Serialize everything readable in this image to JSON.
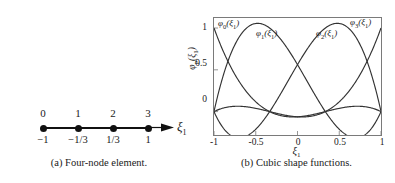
{
  "figure": {
    "panel_a": {
      "caption": "(a)  Four-node element.",
      "axis_symbol": "ξ",
      "axis_symbol_sub": "1",
      "nodes": [
        {
          "index": "0",
          "coord": "−1"
        },
        {
          "index": "1",
          "coord": "−1/3"
        },
        {
          "index": "2",
          "coord": "1/3"
        },
        {
          "index": "3",
          "coord": "1"
        }
      ]
    },
    "panel_b": {
      "caption": "(b)  Cubic shape functions.",
      "xlabel_sym": "ξ",
      "xlabel_sub": "1",
      "ylabel_sym": "φ",
      "ylabel_sub": "p",
      "ylabel_arg": "(ξ",
      "ylabel_arg_sub": "1",
      "ylabel_close": ")",
      "xticks": [
        "-1",
        "-0.5",
        "0",
        "0.5",
        "1"
      ],
      "yticks": [
        "1",
        "0.5",
        "0"
      ],
      "curve_labels": [
        {
          "name": "φ",
          "sub": "0",
          "arg": "(ξ",
          "argsub": "1",
          "close": ")"
        },
        {
          "name": "φ",
          "sub": "1",
          "arg": "(ξ",
          "argsub": "1",
          "close": ")"
        },
        {
          "name": "φ",
          "sub": "2",
          "arg": "(ξ",
          "argsub": "1",
          "close": ")"
        },
        {
          "name": "φ",
          "sub": "3",
          "arg": "(ξ",
          "argsub": "1",
          "close": ")"
        }
      ]
    }
  },
  "colors": {
    "curve": "#333333",
    "axis": "#7a7a7a",
    "node": "#111111",
    "background": "#ffffff"
  },
  "chart_data": {
    "type": "line",
    "title": "",
    "subtitle": "",
    "xlabel": "ξ1",
    "ylabel": "φp(ξ1)",
    "xlim": [
      -1,
      1
    ],
    "ylim": [
      -0.28,
      1.12
    ],
    "xticks": [
      -1,
      -0.5,
      0,
      0.5,
      1
    ],
    "yticks": [
      0,
      0.5,
      1
    ],
    "grid": false,
    "legend_position": "inline-annotations",
    "nodes_xi": [
      -1,
      -0.3333,
      0.3333,
      1
    ],
    "annotations": [
      {
        "text": "φ0(ξ1)",
        "x": -0.89,
        "y": 1.09
      },
      {
        "text": "φ1(ξ1)",
        "x": -0.43,
        "y": 0.96
      },
      {
        "text": "φ2(ξ1)",
        "x": 0.33,
        "y": 0.96
      },
      {
        "text": "φ3(ξ1)",
        "x": 0.76,
        "y": 1.09
      }
    ],
    "x": [
      -1.0,
      -0.9,
      -0.8,
      -0.7,
      -0.6,
      -0.5,
      -0.4,
      -0.3,
      -0.2,
      -0.1,
      0.0,
      0.1,
      0.2,
      0.3,
      0.4,
      0.5,
      0.6,
      0.7,
      0.8,
      0.9,
      1.0
    ],
    "series": [
      {
        "name": "φ0(ξ1)",
        "formula": "-9/16 (ξ-1/3)(ξ+1/3)(ξ-1)",
        "values": [
          1.0,
          0.7172,
          0.4725,
          0.2672,
          0.1025,
          -0.0234,
          -0.1125,
          -0.1672,
          -0.19,
          -0.1838,
          -0.1519,
          -0.0984,
          -0.0275,
          0.0563,
          0.1463,
          0.2391,
          0.3263,
          0.4016,
          0.4575,
          0.4871,
          0.0
        ]
      },
      {
        "name": "φ1(ξ1)",
        "formula": "27/16 (ξ+1)(ξ-1/3)(ξ-1)",
        "values": [
          0.0,
          0.4613,
          0.765,
          0.9319,
          0.9825,
          0.9375,
          0.8175,
          0.6431,
          0.435,
          0.2138,
          0.0,
          -0.1856,
          -0.3225,
          -0.3994,
          -0.405,
          -0.3281,
          -0.1575,
          0.1181,
          0.51,
          1.0294,
          0.0
        ]
      },
      {
        "name": "φ2(ξ1)",
        "formula": "-27/16 (ξ+1)(ξ+1/3)(ξ-1)",
        "values": [
          0.0,
          -0.1603,
          -0.27,
          -0.3347,
          -0.36,
          -0.3516,
          -0.315,
          -0.2559,
          -0.18,
          -0.0928,
          0.0,
          0.0928,
          0.18,
          0.2559,
          0.315,
          0.3516,
          0.36,
          0.3347,
          0.27,
          0.1603,
          0.0
        ]
      },
      {
        "name": "φ3(ξ1)",
        "formula": "9/16 (ξ+1)(ξ+1/3)(ξ-1/3)",
        "values": [
          0.0,
          -0.0169,
          -0.03,
          -0.0394,
          -0.045,
          -0.0469,
          -0.045,
          -0.0394,
          -0.03,
          -0.0169,
          0.0,
          0.0169,
          0.03,
          0.0394,
          0.045,
          0.0469,
          0.045,
          0.0394,
          0.03,
          0.0169,
          1.0
        ]
      }
    ],
    "note": "Four cubic Lagrange basis functions on [-1,1] with nodes at -1, -1/3, 1/3, 1; each equals 1 at its own node and 0 at the others; interior functions overshoot to ~1.0 and undershoot to ~-0.13."
  }
}
